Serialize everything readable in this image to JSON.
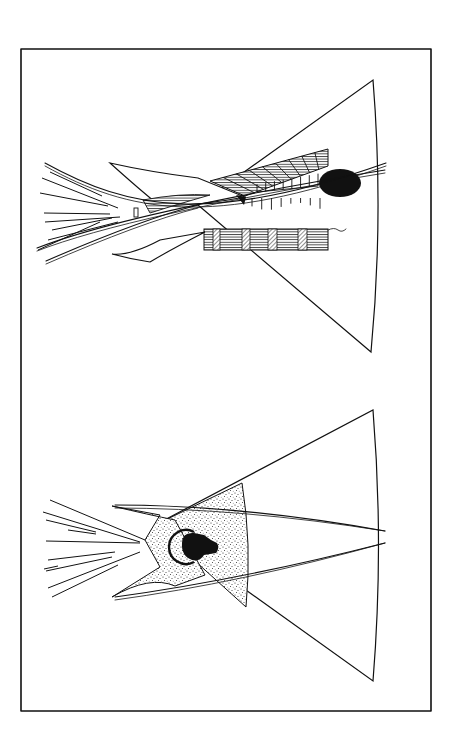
{
  "page": {
    "width": 458,
    "height": 747,
    "background": "#ffffff",
    "ink": "#111111"
  },
  "frame": {
    "x": 21,
    "y": 49,
    "width": 410,
    "height": 662,
    "stroke_width": 1.6
  },
  "figures": [
    {
      "name": "tipi-top-decorated",
      "cover": {
        "apex": [
          198,
          205
        ],
        "top_corner": [
          373,
          80
        ],
        "bottom_corner": [
          371,
          352
        ],
        "arc_bulge": 384
      },
      "flap_left": [
        [
          110,
          163
        ],
        [
          150,
          186
        ],
        [
          195,
          177
        ],
        [
          245,
          197
        ],
        [
          205,
          210
        ],
        [
          162,
          210
        ],
        [
          143,
          200
        ]
      ],
      "flap_lower": [
        [
          112,
          254
        ],
        [
          160,
          240
        ],
        [
          205,
          232
        ],
        [
          165,
          255
        ],
        [
          124,
          258
        ]
      ],
      "poles": [
        [
          [
            45,
            163
          ],
          [
            130,
            210
          ],
          [
            210,
            225
          ],
          [
            386,
            163
          ]
        ],
        [
          [
            37,
            248
          ],
          [
            130,
            212
          ],
          [
            385,
            170
          ]
        ],
        [
          [
            46,
            261
          ],
          [
            140,
            220
          ],
          [
            198,
            205
          ]
        ]
      ],
      "pole_tips": [
        [
          [
            42,
            178
          ],
          [
            118,
            208
          ]
        ],
        [
          [
            40,
            193
          ],
          [
            108,
            206
          ]
        ],
        [
          [
            44,
            213
          ],
          [
            110,
            214
          ]
        ],
        [
          [
            45,
            222
          ],
          [
            120,
            217
          ]
        ],
        [
          [
            48,
            240
          ],
          [
            118,
            222
          ]
        ],
        [
          [
            38,
            250
          ],
          [
            100,
            222
          ]
        ],
        [
          [
            50,
            172
          ],
          [
            102,
            196
          ]
        ],
        [
          [
            52,
            230
          ],
          [
            112,
            218
          ]
        ]
      ],
      "top_band": {
        "points": [
          [
            210,
            181
          ],
          [
            328,
            149
          ],
          [
            328,
            166
          ],
          [
            245,
            196
          ]
        ],
        "stripes": 9
      },
      "lower_band": {
        "x": 204,
        "y": 229,
        "width": 124,
        "height": 21,
        "hatched_blocks": [
          [
            213,
            7
          ],
          [
            242,
            8
          ],
          [
            268,
            9
          ],
          [
            298,
            9
          ]
        ]
      },
      "sun_disc": {
        "cx": 340,
        "cy": 183,
        "rx": 21,
        "ry": 14
      },
      "hanging_lines_upper": {
        "x_start": 257,
        "x_end": 318,
        "y_base": 192,
        "length": 13,
        "count": 8
      },
      "hanging_lines_lower": {
        "x_start": 252,
        "x_end": 320,
        "y_top": 198,
        "length": 12,
        "count": 8
      },
      "small_triangle": [
        [
          236,
          195
        ],
        [
          246,
          197
        ],
        [
          244,
          205
        ]
      ]
    },
    {
      "name": "tipi-bottom-buffalo",
      "cover": {
        "apex": [
          155,
          525
        ],
        "top_corner": [
          373,
          410
        ],
        "bottom_corner": [
          373,
          681
        ],
        "arc_bulge": 384
      },
      "stippled_band": {
        "inner_apex": [
          155,
          525
        ],
        "outer_x": 246,
        "top": [
          242,
          483
        ],
        "bottom": [
          246,
          607
        ]
      },
      "smoke_flaps": [
        [
          112,
          506
        ],
        [
          145,
          540
        ],
        [
          112,
          597
        ]
      ],
      "poles": [
        [
          [
            115,
            505
          ],
          [
            240,
            505
          ],
          [
            385,
            531
          ]
        ],
        [
          [
            115,
            597
          ],
          [
            240,
            580
          ],
          [
            385,
            543
          ]
        ]
      ],
      "pole_tips": [
        [
          [
            50,
            500
          ],
          [
            145,
            540
          ]
        ],
        [
          [
            43,
            512
          ],
          [
            140,
            542
          ]
        ],
        [
          [
            46,
            520
          ],
          [
            96,
            532
          ]
        ],
        [
          [
            46,
            541
          ],
          [
            140,
            543
          ]
        ],
        [
          [
            48,
            560
          ],
          [
            115,
            552
          ]
        ],
        [
          [
            46,
            571
          ],
          [
            112,
            557
          ]
        ],
        [
          [
            48,
            588
          ],
          [
            140,
            552
          ]
        ],
        [
          [
            52,
            597
          ],
          [
            118,
            565
          ]
        ],
        [
          [
            44,
            569
          ],
          [
            58,
            566
          ]
        ],
        [
          [
            68,
            530
          ],
          [
            96,
            534
          ]
        ]
      ],
      "buffalo_head": {
        "cx": 200,
        "cy": 548,
        "horn_cx": 190,
        "horn_cy": 547,
        "horn_r": 17
      }
    }
  ]
}
